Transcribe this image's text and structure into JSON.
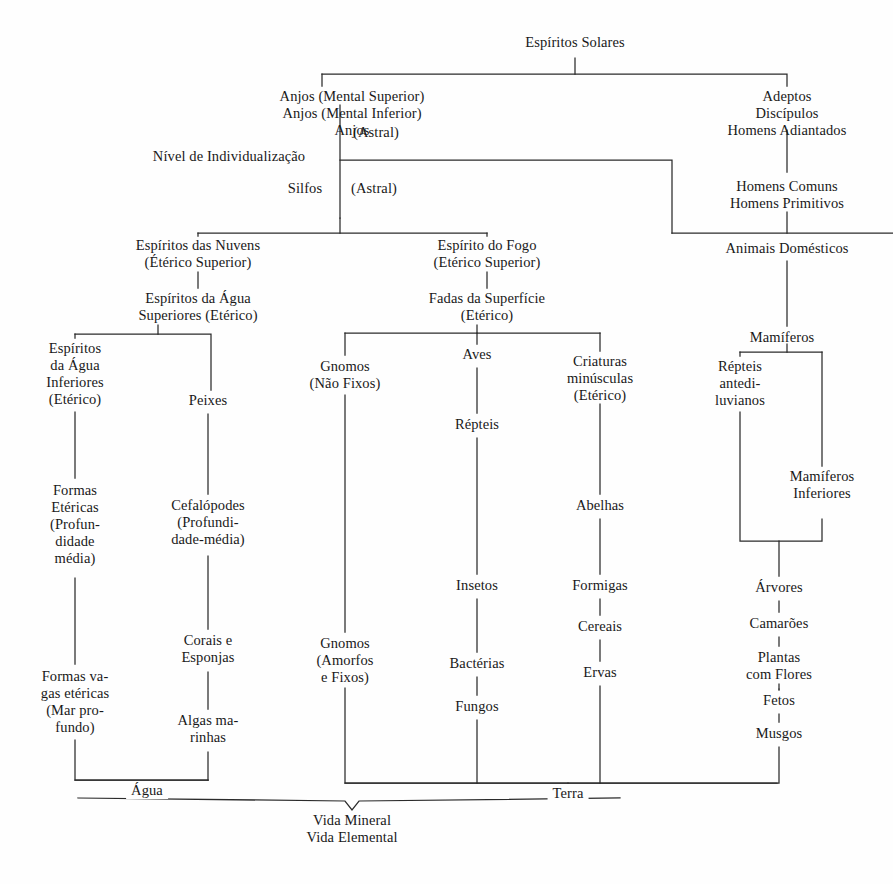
{
  "diagram": {
    "title_node": "Espíritos Solares",
    "bottom_note": "Vida Mineral\nVida Elemental",
    "line_color": "#2b2b2b",
    "text_color": "#191919",
    "background": "#fefefe",
    "nodes": [
      {
        "id": "espiritos-solares",
        "text": "Espíritos Solares",
        "x": 575,
        "y": 42,
        "align": "center"
      },
      {
        "id": "anjos-grupo",
        "text": "Anjos (Mental Superior)\nAnjos (Mental Inferior)\nAnjos",
        "x": 352,
        "y": 88,
        "align": "center"
      },
      {
        "id": "anjos-astral",
        "text": "(Astral)",
        "x": 376,
        "y": 124,
        "align": "center"
      },
      {
        "id": "adeptos-grupo",
        "text": "Adeptos\nDiscípulos\nHomens Adiantados",
        "x": 787,
        "y": 88,
        "align": "center"
      },
      {
        "id": "nivel-individualizacao",
        "text": "Nível de Individualização",
        "x": 229,
        "y": 148,
        "align": "center"
      },
      {
        "id": "silfos",
        "text": "Silfos",
        "x": 305,
        "y": 184,
        "align": "center"
      },
      {
        "id": "silfos-astral",
        "text": "(Astral)",
        "x": 374,
        "y": 184,
        "align": "center"
      },
      {
        "id": "homens-comuns",
        "text": "Homens Comuns\nHomens Primitivos",
        "x": 787,
        "y": 180,
        "align": "center"
      },
      {
        "id": "espiritos-das-nuvens",
        "text": "Espíritos das Nuvens\n(Étérico Superior)",
        "x": 198,
        "y": 243,
        "align": "center"
      },
      {
        "id": "espirito-do-fogo",
        "text": "Espírito do Fogo\n(Etérico Superior)",
        "x": 487,
        "y": 243,
        "align": "center"
      },
      {
        "id": "animais-domesticos",
        "text": "Animais Domésticos",
        "x": 787,
        "y": 245,
        "align": "center"
      },
      {
        "id": "espiritos-agua-superiores",
        "text": "Espíritos da Água\nSuperiores (Etérico)",
        "x": 198,
        "y": 296,
        "align": "center"
      },
      {
        "id": "fadas-da-superficie",
        "text": "Fadas da Superfície\n(Etérico)",
        "x": 487,
        "y": 296,
        "align": "center"
      },
      {
        "id": "mamiferos",
        "text": "Mamíferos",
        "x": 782,
        "y": 335,
        "align": "center"
      },
      {
        "id": "espiritos-agua-inferiores",
        "text": "Espíritos\nda Água\nInferiores\n(Etérico)",
        "x": 75,
        "y": 345,
        "align": "center"
      },
      {
        "id": "gnomos-nao-fixos",
        "text": "Gnomos\n(Não Fixos)",
        "x": 345,
        "y": 364,
        "align": "center"
      },
      {
        "id": "aves",
        "text": "Aves",
        "x": 477,
        "y": 352,
        "align": "center"
      },
      {
        "id": "criaturas-minusculas",
        "text": "Criaturas\nminúsculas\n(Etérico)",
        "x": 600,
        "y": 360,
        "align": "center"
      },
      {
        "id": "repteis-antediluvianos",
        "text": "Répteis\nantedi-\nluvianos",
        "x": 740,
        "y": 364,
        "align": "center"
      },
      {
        "id": "peixes",
        "text": "Peixes",
        "x": 208,
        "y": 398,
        "align": "center"
      },
      {
        "id": "repteis",
        "text": "Répteis",
        "x": 477,
        "y": 422,
        "align": "center"
      },
      {
        "id": "mamiferos-inferiores",
        "text": "Mamíferos\nInferiores",
        "x": 822,
        "y": 475,
        "align": "center"
      },
      {
        "id": "formas-etericas",
        "text": "Formas\nEtéricas\n(Profun-\ndidade\nmédia)",
        "x": 75,
        "y": 487,
        "align": "center"
      },
      {
        "id": "cefalopodes",
        "text": "Cefalópodes\n(Profundi-\ndade-média)",
        "x": 208,
        "y": 503,
        "align": "center"
      },
      {
        "id": "abelhas",
        "text": "Abelhas",
        "x": 600,
        "y": 503,
        "align": "center"
      },
      {
        "id": "insetos",
        "text": "Insetos",
        "x": 477,
        "y": 583,
        "align": "center"
      },
      {
        "id": "formigas",
        "text": "Formigas",
        "x": 600,
        "y": 583,
        "align": "center"
      },
      {
        "id": "arvores",
        "text": "Árvores",
        "x": 779,
        "y": 585,
        "align": "center"
      },
      {
        "id": "corais-e-esponjas",
        "text": "Corais e\nEsponjas",
        "x": 208,
        "y": 638,
        "align": "center"
      },
      {
        "id": "cereais",
        "text": "Cereais",
        "x": 600,
        "y": 624,
        "align": "center"
      },
      {
        "id": "camaroes",
        "text": "Camarões",
        "x": 779,
        "y": 621,
        "align": "center"
      },
      {
        "id": "gnomos-amorfos",
        "text": "Gnomos\n(Amorfos\ne Fixos)",
        "x": 345,
        "y": 641,
        "align": "center"
      },
      {
        "id": "bacterias",
        "text": "Bactérias",
        "x": 477,
        "y": 661,
        "align": "center"
      },
      {
        "id": "ervas",
        "text": "Ervas",
        "x": 600,
        "y": 670,
        "align": "center"
      },
      {
        "id": "plantas-com-flores",
        "text": "Plantas\ncom Flores",
        "x": 779,
        "y": 655,
        "align": "center"
      },
      {
        "id": "formas-vagas",
        "text": "Formas va-\ngas etéricas\n(Mar pro-\nfundo)",
        "x": 75,
        "y": 673,
        "align": "center"
      },
      {
        "id": "fungos",
        "text": "Fungos",
        "x": 477,
        "y": 704,
        "align": "center"
      },
      {
        "id": "fetos",
        "text": "Fetos",
        "x": 779,
        "y": 698,
        "align": "center"
      },
      {
        "id": "algas-marinhas",
        "text": "Algas ma-\nrinhas",
        "x": 208,
        "y": 718,
        "align": "center"
      },
      {
        "id": "musgos",
        "text": "Musgos",
        "x": 779,
        "y": 731,
        "align": "center"
      }
    ],
    "wire_labels": [
      {
        "id": "agua",
        "text": "Água",
        "x": 147,
        "y": 782
      },
      {
        "id": "terra",
        "text": "Terra",
        "x": 568,
        "y": 789
      }
    ],
    "footer": {
      "id": "vida-mineral-elemental",
      "text": "Vida Mineral\nVida Elemental",
      "x": 352,
      "y": 810
    }
  }
}
